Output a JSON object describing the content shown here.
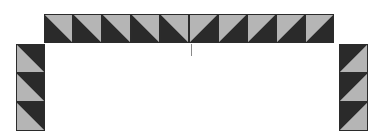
{
  "diagram": {
    "colors": {
      "dark": "#2a2a2a",
      "light": "#b5b5b5",
      "background": "#ffffff",
      "tick": "#8a8a8a"
    },
    "tile_size": 29,
    "top_row": {
      "count": 10,
      "x": 44,
      "y": 14,
      "left_half_pattern": "light-top-right",
      "right_half_pattern": "light-top-left"
    },
    "left_column": {
      "count": 3,
      "x": 16,
      "y": 44,
      "pattern": "dark-top-right"
    },
    "right_column": {
      "count": 3,
      "x": 339,
      "y": 44,
      "pattern": "dark-top-left"
    },
    "center_tick": {
      "x": 191,
      "y1": 44,
      "y2": 56
    }
  }
}
